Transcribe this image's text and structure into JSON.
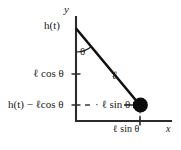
{
  "diagram": {
    "axes": {
      "y_label": "y",
      "x_label": "x"
    },
    "labels": {
      "pivot_height": "h(t)",
      "angle": "θ",
      "rod_length": "ℓ",
      "vertical_component": "ℓ cos θ",
      "bob_height": "h(t) − ℓcos θ",
      "horizontal_inner": "· ℓ sin θ",
      "horizontal_axis": "ℓ sin θ"
    },
    "colors": {
      "ink": "#1a1a1a",
      "axis": "#2b2b2b",
      "rod": "#111111",
      "bob": "#0d0d0d",
      "background": "#ffffff"
    },
    "geometry": {
      "pivot": [
        76,
        29
      ],
      "bob": [
        140,
        105
      ],
      "y_axis_top": [
        76,
        16
      ],
      "origin": [
        76,
        121
      ],
      "x_axis_right": [
        172,
        121
      ],
      "angle_deg": 40
    },
    "icon_names": {
      "bob": "pendulum-bob-icon",
      "arrow_right": "arrow-right-icon",
      "tick": "tick-mark-icon"
    }
  }
}
